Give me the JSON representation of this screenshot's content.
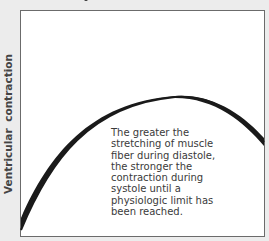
{
  "diagram": {
    "y_axis_label": "Ventricular contraction",
    "caption_lines": [
      "The greater the",
      "stretching of muscle",
      "fiber during diastole,",
      "the stronger the",
      "contraction during",
      "systole until a",
      "physiologic limit has",
      "been reached."
    ],
    "curve_color": "#1a1a1a",
    "background_color": "#ffffff"
  }
}
